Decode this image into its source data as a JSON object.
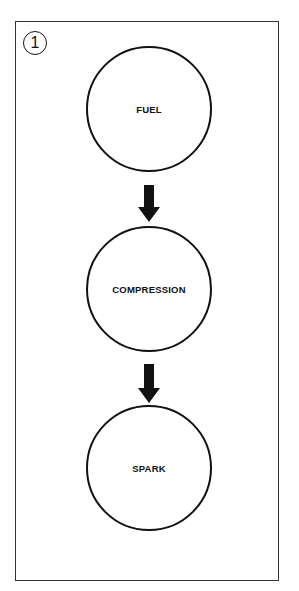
{
  "diagram": {
    "step_number": "1",
    "nodes": [
      {
        "label": "FUEL"
      },
      {
        "label": "COMPRESSION"
      },
      {
        "label": "SPARK"
      }
    ],
    "arrows": [
      {
        "from": "FUEL",
        "to": "COMPRESSION"
      },
      {
        "from": "COMPRESSION",
        "to": "SPARK"
      }
    ],
    "colors": {
      "stroke": "#111111",
      "background": "#ffffff"
    }
  }
}
